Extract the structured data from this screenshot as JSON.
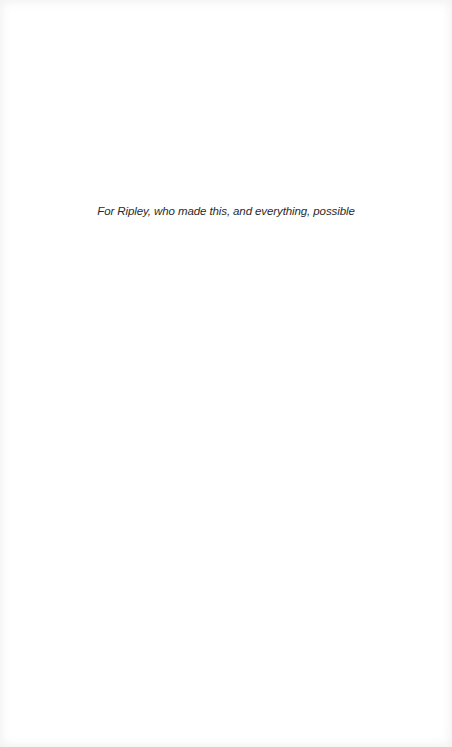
{
  "page": {
    "dedication": "For Ripley, who made this, and everything, possible"
  }
}
